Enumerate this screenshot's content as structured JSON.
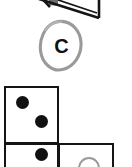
{
  "page": {
    "width": 132,
    "height": 167,
    "background_color": "#ffffff"
  },
  "colors": {
    "ink_black": "#151515",
    "pip_black": "#111111",
    "pencil_gray": "#9a9a9a",
    "shade_gray": "#6e6e6e",
    "paper_white": "#ffffff"
  },
  "top_figure": {
    "name": "clipped-outline-shape",
    "note": "Bottom portion of a black outlined quadrilateral cut off by the top edge of the crop, containing a gray shaded band",
    "outline_color": "#151515",
    "shade_color": "#6e6e6e"
  },
  "circled_letter": {
    "letter": "C",
    "circle_style": "hand-drawn oval",
    "circle_color": "#9a9a9a",
    "letter_color": "#111111"
  },
  "domino_grid": {
    "cells": [
      {
        "name": "cell-top-left",
        "pip_count": 2,
        "pip_style": "filled",
        "pips": [
          {
            "cx": 21,
            "cy": 19,
            "r": 6.5
          },
          {
            "cx": 40,
            "cy": 38,
            "r": 6.5
          }
        ]
      },
      {
        "name": "cell-bottom-left",
        "pip_count": 1,
        "pip_style": "filled",
        "clipped": true,
        "pips": [
          {
            "cx": 40,
            "cy": 10,
            "r": 6.5
          }
        ]
      },
      {
        "name": "cell-bottom-right",
        "pip_count": 1,
        "pip_style": "outline",
        "clipped": true,
        "pips": [
          {
            "cx": 29,
            "cy": 17,
            "r": 10
          }
        ]
      }
    ]
  }
}
